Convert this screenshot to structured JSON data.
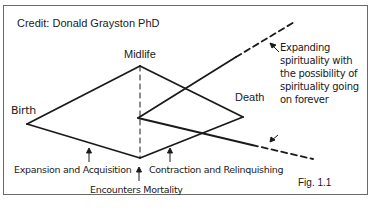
{
  "diagram": {
    "credit": "Credit: Donald Grayston  PhD",
    "nodes": {
      "top": "Midlife",
      "left": "Birth",
      "right": "Death"
    },
    "annotations": {
      "expanding_spirituality": "Expanding spirituality with the possibility of spirituality going on forever",
      "expansion": "Expansion and Acquisition",
      "contraction": "Contraction and Relinquishing",
      "mortality": "Encounters Mortality"
    },
    "figure_label": "Fig. 1.1",
    "cutoff_text": "…",
    "colors": {
      "line": "#1a1a1a",
      "frame": "#6a6a6a",
      "background": "#ffffff"
    }
  }
}
